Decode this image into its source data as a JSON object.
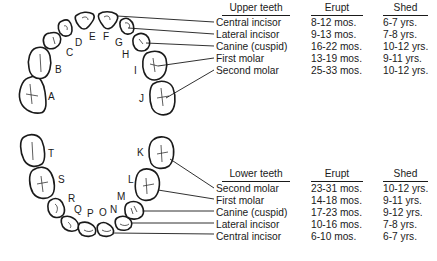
{
  "upper": {
    "headers": {
      "teeth": "Upper teeth",
      "erupt": "Erupt",
      "shed": "Shed"
    },
    "rows": [
      {
        "tooth": "Central incisor",
        "erupt": "8-12 mos.",
        "shed": "6-7 yrs."
      },
      {
        "tooth": "Lateral incisor",
        "erupt": "9-13 mos.",
        "shed": "7-8 yrs."
      },
      {
        "tooth": "Canine (cuspid)",
        "erupt": "16-22 mos.",
        "shed": "10-12 yrs."
      },
      {
        "tooth": "First molar",
        "erupt": "13-19 mos.",
        "shed": "9-11 yrs."
      },
      {
        "tooth": "Second molar",
        "erupt": "25-33 mos.",
        "shed": "10-12 yrs."
      }
    ],
    "tooth_letters": [
      "A",
      "B",
      "C",
      "D",
      "E",
      "F",
      "G",
      "H",
      "I",
      "J"
    ]
  },
  "lower": {
    "headers": {
      "teeth": "Lower teeth",
      "erupt": "Erupt",
      "shed": "Shed"
    },
    "rows": [
      {
        "tooth": "Second molar",
        "erupt": "23-31 mos.",
        "shed": "10-12 yrs."
      },
      {
        "tooth": "First molar",
        "erupt": "14-18 mos.",
        "shed": "9-11 yrs."
      },
      {
        "tooth": "Canine (cuspid)",
        "erupt": "17-23 mos.",
        "shed": "9-12 yrs."
      },
      {
        "tooth": "Lateral incisor",
        "erupt": "10-16 mos.",
        "shed": "7-8 yrs."
      },
      {
        "tooth": "Central incisor",
        "erupt": "6-10 mos.",
        "shed": "6-7 yrs."
      }
    ],
    "tooth_letters": [
      "K",
      "L",
      "M",
      "N",
      "O",
      "P",
      "Q",
      "R",
      "S",
      "T"
    ]
  }
}
